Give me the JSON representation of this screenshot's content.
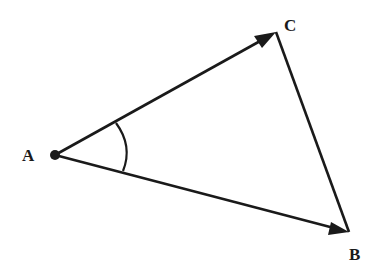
{
  "diagram": {
    "type": "vector-triangle",
    "stroke_color": "#1a1a1a",
    "background": "#ffffff",
    "points": {
      "A": {
        "label": "A",
        "x": 55,
        "y": 155
      },
      "B": {
        "label": "B",
        "x": 349,
        "y": 232
      },
      "C": {
        "label": "C",
        "x": 276,
        "y": 32
      }
    },
    "arrows": [
      {
        "from": "A",
        "to": "C"
      },
      {
        "from": "A",
        "to": "B"
      }
    ],
    "segments": [
      {
        "from": "C",
        "to": "B"
      }
    ],
    "angle_marker": {
      "at": "A",
      "between": [
        "C",
        "B"
      ]
    }
  }
}
